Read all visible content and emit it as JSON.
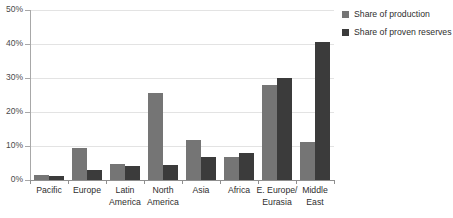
{
  "chart_data": {
    "type": "bar",
    "title": "",
    "subtitle": "",
    "xlabel": "",
    "ylabel": "",
    "ylim": [
      0,
      50
    ],
    "yticks": [
      "0%",
      "10%",
      "20%",
      "30%",
      "40%",
      "50%"
    ],
    "ytick_values": [
      0,
      10,
      20,
      30,
      40,
      50
    ],
    "grid": true,
    "legend_position": "top-right",
    "categories": [
      "Pacific",
      "Europe",
      "Latin\nAmerica",
      "North\nAmerica",
      "Asia",
      "Africa",
      "E. Europe/\nEurasia",
      "Middle\nEast"
    ],
    "series": [
      {
        "name": "Share of production",
        "color": "#757575",
        "values": [
          1.6,
          9.5,
          4.6,
          25.5,
          11.7,
          6.8,
          28.0,
          11.3
        ]
      },
      {
        "name": "Share of proven reserves",
        "color": "#3b3b3b",
        "values": [
          1.3,
          3.0,
          4.2,
          4.5,
          6.9,
          7.9,
          30.0,
          40.5
        ]
      }
    ]
  },
  "legend": {
    "items": [
      {
        "label": "Share of production",
        "color": "#757575"
      },
      {
        "label": "Share of proven reserves",
        "color": "#3b3b3b"
      }
    ]
  },
  "axis": {
    "y_labels": [
      "50%",
      "40%",
      "30%",
      "20%",
      "10%",
      "0%"
    ]
  },
  "colors": {
    "series_light": "#757575",
    "series_dark": "#3b3b3b",
    "gridline": "#e3e3e3",
    "axis": "#8f8f8f",
    "text": "#2e2e2e",
    "background": "#ffffff"
  }
}
